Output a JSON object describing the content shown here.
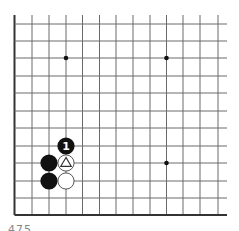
{
  "diagram": {
    "type": "go-board-fragment",
    "colors": {
      "background": "#ffffff",
      "grid_line": "#6a6a6a",
      "edge_line": "#333333",
      "black_stone": "#111111",
      "white_stone_fill": "#ffffff",
      "white_stone_stroke": "#555555",
      "star_point": "#111111"
    },
    "grid": {
      "columns_x": [
        14.5,
        32,
        49,
        66,
        82.5,
        99.5,
        116,
        133,
        150,
        166.5,
        183,
        200,
        218
      ],
      "rows_y": [
        24,
        41,
        58,
        76,
        93,
        111,
        128,
        146,
        163,
        181,
        198,
        215
      ],
      "open_top_y": 15,
      "open_right_x": 227,
      "edges": [
        "left",
        "bottom"
      ]
    },
    "star_points": [
      {
        "col": 3,
        "row": 2
      },
      {
        "col": 9,
        "row": 2
      },
      {
        "col": 9,
        "row": 8
      }
    ],
    "stones": [
      {
        "color": "black",
        "col": 3,
        "row": 7,
        "label": "1",
        "marker": null
      },
      {
        "color": "black",
        "col": 2,
        "row": 8,
        "label": null,
        "marker": null
      },
      {
        "color": "black",
        "col": 2,
        "row": 9,
        "label": null,
        "marker": null
      },
      {
        "color": "white",
        "col": 3,
        "row": 8,
        "label": null,
        "marker": "triangle"
      },
      {
        "color": "white",
        "col": 3,
        "row": 9,
        "label": null,
        "marker": null
      }
    ],
    "stone_radius": 8.6
  },
  "caption": {
    "text": "475"
  }
}
